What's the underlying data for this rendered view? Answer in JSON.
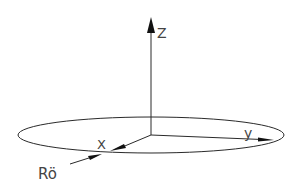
{
  "diagram": {
    "type": "3d-coordinate-system",
    "colors": {
      "line": "#2a2a2a",
      "label": "#444444",
      "background": "#ffffff"
    },
    "axes": {
      "z": {
        "label": "Z"
      },
      "y": {
        "label": "y"
      },
      "x": {
        "label": "X"
      }
    },
    "beam": {
      "label": "Rö"
    },
    "plane": {
      "shape": "ellipse"
    }
  }
}
